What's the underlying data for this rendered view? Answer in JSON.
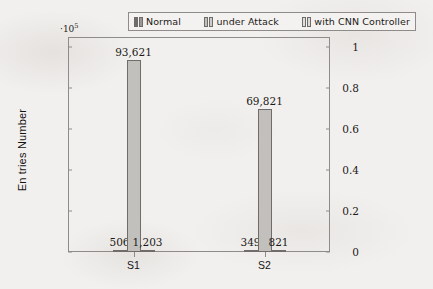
{
  "chart_data": {
    "type": "bar",
    "title": "",
    "subtitle": "",
    "xlabel": "",
    "ylabel": "En tries Number",
    "categories": [
      "S1",
      "S2"
    ],
    "y_multiplier_prefix": "·",
    "y_multiplier_base": "10",
    "y_multiplier_exponent": "5",
    "y_multiplier_text": "·10⁵",
    "y_scale_factor": 100000,
    "ylim": [
      0,
      105000
    ],
    "y_ticks": [
      {
        "value": 0,
        "label": "0"
      },
      {
        "value": 20000,
        "label": "0.2"
      },
      {
        "value": 40000,
        "label": "0.4"
      },
      {
        "value": 60000,
        "label": "0.6"
      },
      {
        "value": 80000,
        "label": "0.8"
      },
      {
        "value": 100000,
        "label": "1"
      }
    ],
    "grid": false,
    "legend_position": "top",
    "series": [
      {
        "name": "Normal",
        "color": "#6f6d6a",
        "values": [
          506,
          349
        ],
        "labels": [
          "506",
          "349"
        ]
      },
      {
        "name": "under Attack",
        "color": "#c2c0bd",
        "values": [
          93621,
          69821
        ],
        "labels": [
          "93,621",
          "69,821"
        ]
      },
      {
        "name": "with CNN Controller",
        "color": "#e2e0dd",
        "values": [
          1203,
          821
        ],
        "labels": [
          "1,203",
          "821"
        ]
      }
    ]
  },
  "legend": {
    "entries": [
      {
        "label": "Normal"
      },
      {
        "label": "under Attack"
      },
      {
        "label": "with CNN Controller"
      }
    ]
  },
  "axes": {
    "y_title": "En tries Number"
  }
}
